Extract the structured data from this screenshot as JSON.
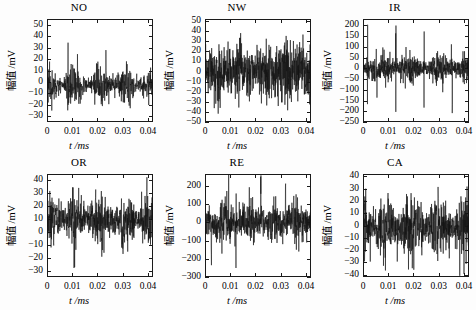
{
  "figure": {
    "background": "#fdfdfd",
    "trace_color": "#141414",
    "axis_color": "#1a1a1a",
    "rows": 2,
    "cols": 3
  },
  "chart_data": [
    {
      "type": "line",
      "title": "NO",
      "xlabel": "t /ms",
      "ylabel": "幅值 /mV",
      "xlim": [
        0,
        0.042
      ],
      "ylim": [
        -35,
        55
      ],
      "xticks": [
        0,
        0.01,
        0.02,
        0.03,
        0.04
      ],
      "xticklabels": [
        "0",
        "0.01",
        "0.02",
        "0.03",
        "0.04"
      ],
      "yticks": [
        -30,
        -20,
        -10,
        0,
        10,
        20,
        30,
        40,
        50
      ],
      "yticklabels": [
        "−30",
        "−20",
        "−10",
        "0",
        "10",
        "20",
        "30",
        "40",
        "50"
      ],
      "grid": false,
      "legend": null,
      "signal": {
        "n": 620,
        "description": "vibration waveform, amplitude-modulated noise burst train",
        "seed": 11,
        "noise_amp": 9,
        "offset": -3,
        "envelope": {
          "period": 0.0105,
          "phase": 0.0055,
          "low": 0.35,
          "high": 1.0,
          "sharpness": 2.2
        },
        "peak_scale": 1.9,
        "clip": [
          -34,
          54
        ]
      }
    },
    {
      "type": "line",
      "title": "NW",
      "xlabel": "t /ms",
      "ylabel": "幅值 /mV",
      "xlim": [
        0,
        0.042
      ],
      "ylim": [
        -50,
        52
      ],
      "xticks": [
        0,
        0.01,
        0.02,
        0.03,
        0.04
      ],
      "xticklabels": [
        "0",
        "0.01",
        "0.02",
        "0.03",
        "0.04"
      ],
      "yticks": [
        -50,
        -40,
        -30,
        -20,
        -10,
        0,
        10,
        20,
        30,
        40,
        50
      ],
      "yticklabels": [
        "−50",
        "−40",
        "−30",
        "−20",
        "−10",
        "0",
        "10",
        "20",
        "30",
        "40",
        "50"
      ],
      "grid": false,
      "legend": null,
      "signal": {
        "n": 700,
        "description": "broadband noise, nearly uniform amplitude with occasional large spikes",
        "seed": 23,
        "noise_amp": 14,
        "offset": 0,
        "envelope": {
          "period": 0.0085,
          "phase": 0.002,
          "low": 0.72,
          "high": 1.0,
          "sharpness": 1.2
        },
        "peak_scale": 2.0,
        "clip": [
          -52,
          52
        ]
      }
    },
    {
      "type": "line",
      "title": "IR",
      "xlabel": "t /ms",
      "ylabel": "幅值 /mV",
      "xlim": [
        0,
        0.042
      ],
      "ylim": [
        -250,
        230
      ],
      "xticks": [
        0,
        0.01,
        0.02,
        0.03,
        0.04
      ],
      "xticklabels": [
        "0",
        "0.01",
        "0.02",
        "0.03",
        "0.04"
      ],
      "yticks": [
        -250,
        -200,
        -150,
        -100,
        -50,
        0,
        50,
        100,
        150,
        200
      ],
      "yticklabels": [
        "−250",
        "−200",
        "−150",
        "−100",
        "−50",
        "0",
        "50",
        "100",
        "150",
        "200"
      ],
      "grid": false,
      "legend": null,
      "signal": {
        "n": 760,
        "description": "low-level noise floor with periodic high-amplitude impulse spikes (inner race fault)",
        "seed": 37,
        "noise_amp": 35,
        "offset": 0,
        "envelope": {
          "period": 0.0112,
          "phase": 0.0018,
          "low": 0.5,
          "high": 1.0,
          "sharpness": 1.6
        },
        "impulses": {
          "period": 0.0112,
          "phase": 0.0018,
          "amp": 215,
          "count": 5
        },
        "peak_scale": 2.2,
        "clip": [
          -245,
          225
        ]
      }
    },
    {
      "type": "line",
      "title": "OR",
      "xlabel": "t /ms",
      "ylabel": "幅值 /mV",
      "xlim": [
        0,
        0.042
      ],
      "ylim": [
        -35,
        45
      ],
      "xticks": [
        0,
        0.01,
        0.02,
        0.03,
        0.04
      ],
      "xticklabels": [
        "0",
        "0.01",
        "0.02",
        "0.03",
        "0.04"
      ],
      "yticks": [
        -30,
        -20,
        -10,
        0,
        10,
        20,
        30,
        40
      ],
      "yticklabels": [
        "−30",
        "−20",
        "−10",
        "0",
        "10",
        "20",
        "30",
        "40"
      ],
      "grid": false,
      "legend": null,
      "signal": {
        "n": 680,
        "description": "positively biased modulated noise with periodic bursts (outer race fault)",
        "seed": 51,
        "noise_amp": 11,
        "offset": 9,
        "envelope": {
          "period": 0.0098,
          "phase": 0.0062,
          "low": 0.42,
          "high": 1.0,
          "sharpness": 2.0
        },
        "peak_scale": 1.85,
        "clip": [
          -34,
          44
        ]
      }
    },
    {
      "type": "line",
      "title": "RE",
      "xlabel": "t /ms",
      "ylabel": "幅值 /mV",
      "xlim": [
        0,
        0.042
      ],
      "ylim": [
        -300,
        265
      ],
      "xticks": [
        0,
        0.01,
        0.02,
        0.03,
        0.04
      ],
      "xticklabels": [
        "0",
        "0.01",
        "0.02",
        "0.03",
        "0.04"
      ],
      "yticks": [
        -300,
        -200,
        -100,
        0,
        100,
        200
      ],
      "yticklabels": [
        "−300",
        "−200",
        "−100",
        "0",
        "100",
        "200"
      ],
      "grid": false,
      "legend": null,
      "signal": {
        "n": 740,
        "description": "dense noise band around zero with intermittent large transients (rolling element fault)",
        "seed": 67,
        "noise_amp": 58,
        "offset": 0,
        "envelope": {
          "period": 0.0098,
          "phase": 0.0025,
          "low": 0.48,
          "high": 1.0,
          "sharpness": 1.7
        },
        "impulses": {
          "period": 0.0098,
          "phase": 0.0025,
          "amp": 235,
          "count": 4
        },
        "peak_scale": 2.1,
        "clip": [
          -295,
          260
        ]
      }
    },
    {
      "type": "line",
      "title": "CA",
      "xlabel": "t /ms",
      "ylabel": "幅值 /mV",
      "xlim": [
        0,
        0.042
      ],
      "ylim": [
        -42,
        42
      ],
      "xticks": [
        0,
        0.01,
        0.02,
        0.03,
        0.04
      ],
      "xticklabels": [
        "0",
        "0.01",
        "0.02",
        "0.03",
        "0.04"
      ],
      "yticks": [
        -40,
        -30,
        -20,
        -10,
        0,
        10,
        20,
        30,
        40
      ],
      "yticklabels": [
        "−40",
        "−30",
        "−20",
        "−10",
        "0",
        "10",
        "20",
        "30",
        "40"
      ],
      "grid": false,
      "legend": null,
      "signal": {
        "n": 700,
        "description": "symmetric modulated noise, moderate amplitude with periodic swelling (cage fault)",
        "seed": 89,
        "noise_amp": 13,
        "offset": -2,
        "envelope": {
          "period": 0.0103,
          "phase": 0.004,
          "low": 0.46,
          "high": 1.0,
          "sharpness": 1.9
        },
        "peak_scale": 1.9,
        "clip": [
          -41,
          41
        ]
      }
    }
  ]
}
